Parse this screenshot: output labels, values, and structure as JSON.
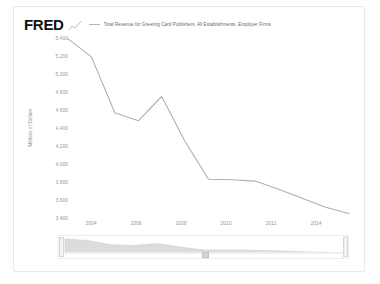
{
  "brand": {
    "logo_text": "FRED",
    "logo_icon": "line-chart-squiggle-icon"
  },
  "legend": {
    "series_label": "Total Revenue for Greeting Card Publishers, All Establishments, Employer Firms",
    "swatch_color": "#b4b4b4"
  },
  "axis": {
    "ylabel": "Millions of Dollars",
    "yticks": [
      "5,400",
      "5,200",
      "5,000",
      "4,800",
      "4,600",
      "4,400",
      "4,200",
      "4,000",
      "3,800",
      "3,600",
      "3,400"
    ],
    "xticks": [
      "2004",
      "2006",
      "2008",
      "2010",
      "2012",
      "2014"
    ]
  },
  "navigator": {
    "left_handle": "range-handle-left",
    "right_handle": "range-handle-right",
    "grip": "range-grip"
  },
  "colors": {
    "line": "#b0b0b0",
    "nav_area": "#d9d9d9",
    "text": "#9a9a9a",
    "card_border": "#e9e9e9"
  },
  "chart_data": {
    "type": "line",
    "title": "Total Revenue for Greeting Card Publishers, All Establishments, Employer Firms",
    "xlabel": "",
    "ylabel": "Millions of Dollars",
    "xlim": [
      2003,
      2015
    ],
    "ylim": [
      3400,
      5400
    ],
    "grid": false,
    "legend_position": "top",
    "x": [
      2003,
      2004,
      2005,
      2006,
      2007,
      2008,
      2009,
      2010,
      2011,
      2012,
      2013,
      2014,
      2015
    ],
    "series": [
      {
        "name": "Total Revenue for Greeting Card Publishers, All Establishments, Employer Firms",
        "values": [
          5390,
          5190,
          4570,
          4480,
          4750,
          4250,
          3830,
          3825,
          3810,
          3720,
          3620,
          3520,
          3450
        ]
      }
    ]
  }
}
